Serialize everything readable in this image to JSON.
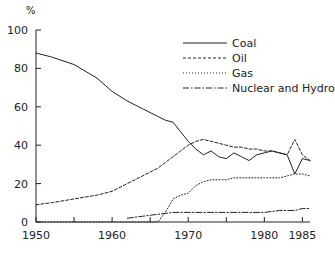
{
  "chart_data": {
    "type": "line",
    "title": "",
    "subtitle": "",
    "xlabel": "",
    "ylabel": "%",
    "ylabel_position": "top-left",
    "xlim": [
      1950,
      1986
    ],
    "ylim": [
      0,
      100
    ],
    "grid": false,
    "legend_position": "top-right",
    "y_ticks": [
      0,
      20,
      40,
      60,
      80,
      100
    ],
    "y_tick_labels": [
      "0",
      "20",
      "40",
      "60",
      "80",
      "100"
    ],
    "x_ticks": [
      1950,
      1955,
      1960,
      1965,
      1970,
      1975,
      1980,
      1985
    ],
    "x_tick_labels_shown": [
      "1950",
      "1960",
      "1970",
      "1980",
      "1985"
    ],
    "x_tick_label_values": [
      1950,
      1960,
      1970,
      1980,
      1985
    ],
    "series": [
      {
        "name": "Coal",
        "style": "solid",
        "color": "#222222",
        "x": [
          1950,
          1952,
          1955,
          1958,
          1960,
          1962,
          1964,
          1966,
          1967,
          1968,
          1969,
          1970,
          1971,
          1972,
          1973,
          1974,
          1975,
          1976,
          1977,
          1978,
          1979,
          1980,
          1981,
          1982,
          1983,
          1984,
          1985,
          1986
        ],
        "y": [
          88,
          86,
          82,
          75,
          68,
          63,
          59,
          55,
          53,
          52,
          47,
          42,
          38,
          35,
          37,
          34,
          33,
          36,
          34,
          32,
          35,
          36,
          37,
          36,
          35,
          25,
          33,
          32
        ]
      },
      {
        "name": "Oil",
        "style": "dashed",
        "color": "#222222",
        "x": [
          1950,
          1952,
          1955,
          1958,
          1960,
          1962,
          1964,
          1966,
          1968,
          1969,
          1970,
          1971,
          1972,
          1973,
          1974,
          1975,
          1976,
          1977,
          1978,
          1979,
          1980,
          1981,
          1982,
          1983,
          1984,
          1985,
          1986
        ],
        "y": [
          9,
          10,
          12,
          14,
          16,
          20,
          24,
          28,
          34,
          37,
          40,
          42,
          43,
          42,
          41,
          40,
          39,
          39,
          38,
          38,
          37,
          37,
          36,
          35,
          43,
          35,
          32
        ]
      },
      {
        "name": "Gas",
        "style": "dotted",
        "color": "#222222",
        "x": [
          1950,
          1962,
          1966,
          1967,
          1968,
          1969,
          1970,
          1971,
          1972,
          1973,
          1974,
          1975,
          1976,
          1977,
          1978,
          1979,
          1980,
          1981,
          1982,
          1983,
          1984,
          1985,
          1986
        ],
        "y": [
          0,
          0,
          0,
          5,
          12,
          14,
          15,
          19,
          21,
          22,
          22,
          22,
          23,
          23,
          23,
          23,
          23,
          23,
          23,
          24,
          25,
          25,
          24
        ]
      },
      {
        "name": "Nuclear and Hydro",
        "style": "dashdot",
        "color": "#222222",
        "x": [
          1962,
          1964,
          1966,
          1968,
          1970,
          1972,
          1974,
          1976,
          1978,
          1980,
          1982,
          1984,
          1985,
          1986
        ],
        "y": [
          2,
          3,
          4,
          5,
          5,
          5,
          5,
          5,
          5,
          5,
          6,
          6,
          7,
          7
        ]
      }
    ]
  },
  "legend": {
    "entries": [
      {
        "label": "Coal"
      },
      {
        "label": "Oil"
      },
      {
        "label": "Gas"
      },
      {
        "label": "Nuclear and Hydro"
      }
    ]
  },
  "axes": {
    "y_unit_label": "%"
  }
}
